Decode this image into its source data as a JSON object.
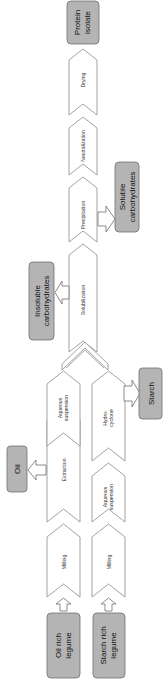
{
  "diagram": {
    "type": "process-flow",
    "orientation": "rotated-90-ccw",
    "colors": {
      "box_fill": "#b4b4b4",
      "box_stroke": "#6e6e6e",
      "chevron_stroke": "#8a8a8a",
      "background": "#ffffff"
    },
    "inputs": {
      "oil_rich": "Oil rich legume",
      "oil_rich_l1": "Oil rich",
      "oil_rich_l2": "legume",
      "starch_rich": "Starch rich legume",
      "starch_rich_l1": "Starch rich",
      "starch_rich_l2": "legume"
    },
    "oil_path": {
      "steps": [
        {
          "label": "Milling"
        },
        {
          "label": "Extraction"
        },
        {
          "label": "Aqueous suspension",
          "l1": "Aqueous",
          "l2": "suspension"
        }
      ]
    },
    "starch_path": {
      "steps": [
        {
          "label": "Milling"
        },
        {
          "label": "Aqueous suspension",
          "l1": "Aqueous",
          "l2": "suspension"
        },
        {
          "label": "Hydro-cyclone",
          "l1": "Hydro-",
          "l2": "cyclone"
        }
      ]
    },
    "common_path": {
      "steps": [
        {
          "label": "Solubilization"
        },
        {
          "label": "Precipitation"
        },
        {
          "label": "Neutralization"
        },
        {
          "label": "Drying"
        }
      ]
    },
    "outputs": {
      "oil": "Oil",
      "starch": "Starch",
      "insoluble": "Insoluble carbohydrates",
      "insoluble_l1": "Insoluble",
      "insoluble_l2": "carbohydrates",
      "soluble": "Soluble carbohydrates",
      "soluble_l1": "Soluble",
      "soluble_l2": "carbohydrates",
      "protein": "Protein isolate",
      "protein_l1": "Protein",
      "protein_l2": "isolate"
    }
  }
}
